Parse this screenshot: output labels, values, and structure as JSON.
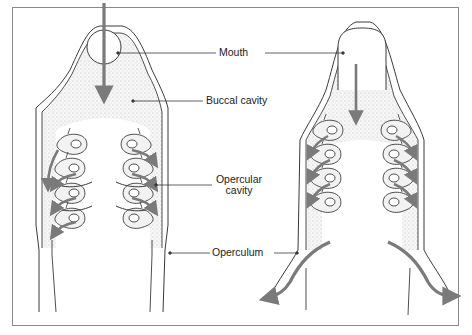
{
  "diagram": {
    "title": "",
    "panels": [
      {
        "id": "left",
        "description": "Fish head in dorsal view, mouth open, water entering buccal cavity"
      },
      {
        "id": "right",
        "description": "Fish head in dorsal view, mouth closed, water exiting through opercula"
      }
    ],
    "labels": {
      "mouth": "Mouth",
      "buccal_cavity": "Buccal cavity",
      "opercular_cavity_line1": "Opercular",
      "opercular_cavity_line2": "cavity",
      "operculum": "Operculum"
    },
    "colors": {
      "line": "#3a3a3a",
      "arrow": "#7a7a7a",
      "gill_fill": "#efefef",
      "shade": "#cfcfcf",
      "frame": "#8a8a8a"
    }
  }
}
